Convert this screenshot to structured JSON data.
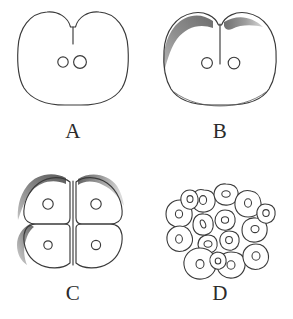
{
  "figure": {
    "background_color": "#ffffff",
    "outline_color": "#3a3a3a",
    "shading_color": "#8d8d8d",
    "label_color": "#2b2b2b"
  },
  "panels": [
    {
      "id": "panel-a",
      "label": "A",
      "stage_name": "two-cell stage, early furrow",
      "cell_count": 2,
      "nuclei_count": 2,
      "shading": "none",
      "description": "Rounded embryo with a shallow cleavage cleft at the top and two small nuclei near the centre."
    },
    {
      "id": "panel-b",
      "label": "B",
      "stage_name": "two-cell stage, complete furrow",
      "cell_count": 2,
      "nuclei_count": 2,
      "shading": "upper-left crescent",
      "description": "Rounded embryo divided by a full vertical furrow with a shaded rim along the upper left."
    },
    {
      "id": "panel-c",
      "label": "C",
      "stage_name": "four-cell stage",
      "cell_count": 4,
      "nuclei_count": 4,
      "shading": "upper and left crescents",
      "description": "Four blastomeres separated by a cross-shaped furrow, each containing one nucleus."
    },
    {
      "id": "panel-d",
      "label": "D",
      "stage_name": "morula",
      "cell_count": 16,
      "nuclei_count": 16,
      "shading": "none",
      "description": "Cluster of many small rounded blastomeres, each with a small nucleus."
    }
  ]
}
